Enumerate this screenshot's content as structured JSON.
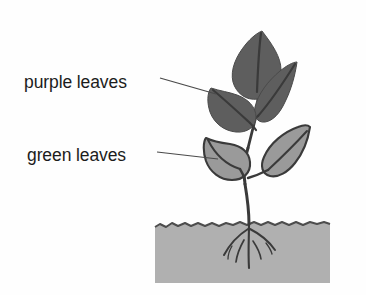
{
  "figure": {
    "background_color": "#fefefe"
  },
  "labels": [
    {
      "id": "purple-leaves",
      "text": "purple leaves",
      "x": 24,
      "y": 88,
      "leader_from_x": 160,
      "leader_from_y": 78,
      "leader_to_x": 216,
      "leader_to_y": 94
    },
    {
      "id": "green-leaves",
      "text": "green leaves",
      "x": 27,
      "y": 161,
      "leader_from_x": 157,
      "leader_from_y": 152,
      "leader_to_x": 218,
      "leader_to_y": 159
    }
  ],
  "colors": {
    "purple_leaf_fill": "#5e5e5e",
    "green_leaf_fill": "#9a9a9a",
    "soil_fill": "#b0b0b0",
    "outline": "#3a3a3a",
    "stem": "#3a3a3a",
    "text": "#1c1c1c",
    "leader_line": "#4a4a4a",
    "background": "#fefefe"
  },
  "plant": {
    "leaf_count_purple": 3,
    "leaf_count_green": 2,
    "purple_leaves": [
      {
        "id": "purple-leaf-top",
        "position": "top-center"
      },
      {
        "id": "purple-leaf-left",
        "position": "mid-left"
      },
      {
        "id": "purple-leaf-right",
        "position": "mid-right"
      }
    ],
    "green_leaves": [
      {
        "id": "green-leaf-left",
        "position": "lower-left"
      },
      {
        "id": "green-leaf-right",
        "position": "lower-right"
      }
    ],
    "stem": {
      "id": "main-stem"
    },
    "roots": {
      "id": "root-system",
      "branch_count": 5
    }
  },
  "soil": {
    "id": "soil-block",
    "x": 155,
    "y": 221,
    "width": 175,
    "height": 62,
    "surface_style": "wavy"
  }
}
